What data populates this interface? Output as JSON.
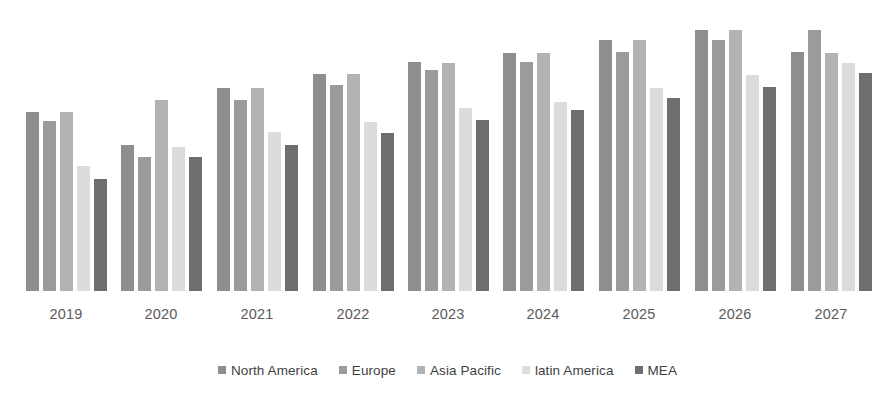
{
  "chart_data": {
    "type": "bar",
    "title": "",
    "subtitle": "",
    "xlabel": "",
    "ylabel": "",
    "grid": false,
    "legend_position": "bottom",
    "axis_visible": false,
    "ylim": [
      0,
      280
    ],
    "categories": [
      "2019",
      "2020",
      "2021",
      "2022",
      "2023",
      "2024",
      "2025",
      "2026",
      "2027"
    ],
    "series": [
      {
        "name": "North America",
        "color": "#8e8e8e",
        "values": [
          179,
          146,
          203,
          217,
          229,
          238,
          251,
          261,
          239
        ]
      },
      {
        "name": "Europe",
        "color": "#9b9b9b",
        "values": [
          170,
          134,
          191,
          206,
          221,
          229,
          239,
          251,
          261
        ]
      },
      {
        "name": "Asia Pacific",
        "color": "#b2b2b2",
        "values": [
          179,
          191,
          203,
          217,
          228,
          238,
          251,
          261,
          238
        ]
      },
      {
        "name": "latin  America",
        "color": "#dcdcdc",
        "values": [
          125,
          144,
          159,
          169,
          183,
          189,
          203,
          216,
          228
        ]
      },
      {
        "name": "MEA",
        "color": "#6e6e6e",
        "values": [
          112,
          134,
          146,
          158,
          171,
          181,
          193,
          204,
          218
        ]
      }
    ]
  },
  "legend": {
    "items": [
      {
        "label": "North America",
        "color": "#8e8e8e"
      },
      {
        "label": "Europe",
        "color": "#9b9b9b"
      },
      {
        "label": "Asia Pacific",
        "color": "#b2b2b2"
      },
      {
        "label": "latin  America",
        "color": "#dcdcdc"
      },
      {
        "label": "MEA",
        "color": "#6e6e6e"
      }
    ]
  },
  "axis": {
    "tick_labels": [
      "2019",
      "2020",
      "2021",
      "2022",
      "2023",
      "2024",
      "2025",
      "2026",
      "2027"
    ]
  },
  "layout": {
    "baseline_y": 291,
    "group_centers": [
      66,
      161,
      257,
      353,
      448,
      543,
      639,
      735,
      831
    ],
    "bar_width": 13,
    "bar_gap": 4,
    "value_to_pixel": 1.0
  }
}
